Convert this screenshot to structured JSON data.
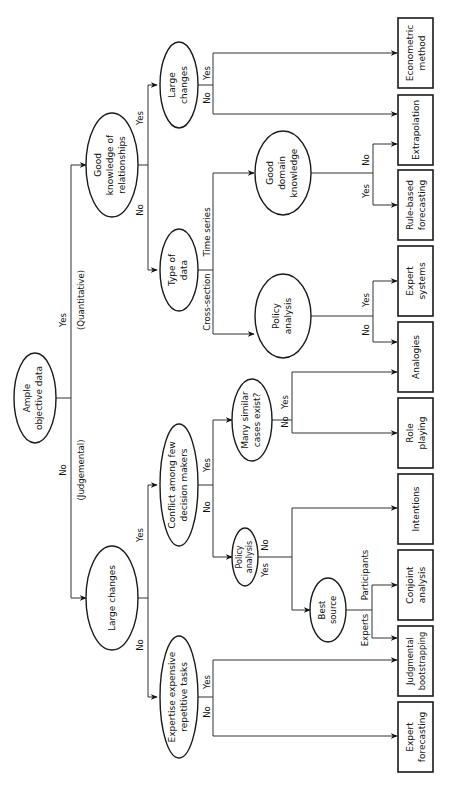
{
  "diagram": {
    "orientation": "rotated-90-ccw",
    "root": {
      "line1": "Ample",
      "line2": "objective data"
    },
    "root_branches": {
      "yes": "Yes",
      "yes_note": "(Quantitative)",
      "no": "No",
      "no_note": "(Judgemental)"
    },
    "decisions": {
      "good_knowledge": {
        "line1": "Good",
        "line2": "knowledge of",
        "line3": "relationships",
        "yes": "Yes",
        "no": "No"
      },
      "large_changes_quant": {
        "line1": "Large",
        "line2": "changes",
        "yes": "Yes",
        "no": "No"
      },
      "type_of_data": {
        "line1": "Type of",
        "line2": "data",
        "a": "Time series",
        "b": "Cross-section"
      },
      "good_domain": {
        "line1": "Good",
        "line2": "domain",
        "line3": "knowledge",
        "yes": "Yes",
        "no": "No"
      },
      "policy_quant": {
        "line1": "Policy",
        "line2": "analysis",
        "yes": "Yes",
        "no": "No"
      },
      "large_changes_judg": {
        "line1": "Large changes",
        "yes": "Yes",
        "no": "No"
      },
      "conflict": {
        "line1": "Conflict among few",
        "line2": "decision makers",
        "yes": "Yes",
        "no": "No"
      },
      "many_similar": {
        "line1": "Many similar",
        "line2": "cases exist?",
        "yes": "Yes",
        "no": "No"
      },
      "policy_judg": {
        "line1": "Policy",
        "line2": "analysis",
        "yes": "Yes",
        "no": "No"
      },
      "best_source": {
        "line1": "Best",
        "line2": "source",
        "a": "Participants",
        "b": "Experts"
      },
      "expertise": {
        "line1": "Expertise expensive",
        "line2": "repetitive tasks",
        "yes": "Yes",
        "no": "No"
      }
    },
    "methods": [
      {
        "line1": "Econometric",
        "line2": "method"
      },
      {
        "line1": "Extrapolation",
        "line2": ""
      },
      {
        "line1": "Rule-based",
        "line2": "forecasting"
      },
      {
        "line1": "Expert",
        "line2": "systems"
      },
      {
        "line1": "Analogies",
        "line2": ""
      },
      {
        "line1": "Role",
        "line2": "playing"
      },
      {
        "line1": "Intentions",
        "line2": ""
      },
      {
        "line1": "Conjoint",
        "line2": "analysis"
      },
      {
        "line1": "Judgmental",
        "line2": "bootstrapping"
      },
      {
        "line1": "Expert",
        "line2": "forecasting"
      }
    ]
  }
}
